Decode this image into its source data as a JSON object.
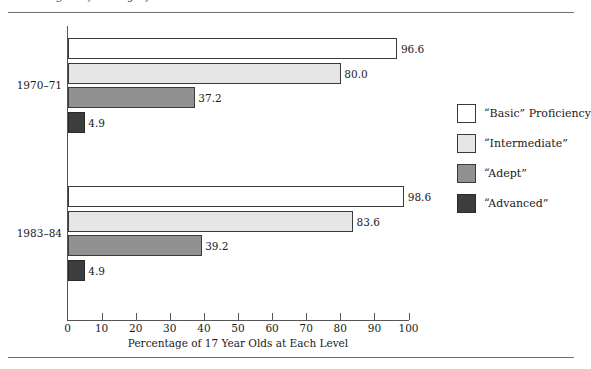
{
  "figure": {
    "clipped_caption": "Reading Proficiency of 17 Year Olds",
    "axis_title": "Percentage of 17 Year Olds at Each Level"
  },
  "legend": {
    "items": [
      {
        "label": "“Basic” Proficiency",
        "key": "basic",
        "color": "#ffffff"
      },
      {
        "label": "“Intermediate”",
        "key": "intermediate",
        "color": "#e6e6e6"
      },
      {
        "label": "“Adept”",
        "key": "adept",
        "color": "#919191"
      },
      {
        "label": "“Advanced”",
        "key": "advanced",
        "color": "#3d3d3d"
      }
    ]
  },
  "ticks": {
    "labels": [
      "0",
      "10",
      "20",
      "30",
      "40",
      "50",
      "60",
      "70",
      "80",
      "90",
      "100"
    ]
  },
  "groups": [
    {
      "label": "1970–71",
      "values": [
        "96.6",
        "80.0",
        "37.2",
        "4.9"
      ]
    },
    {
      "label": "1983–84",
      "values": [
        "98.6",
        "83.6",
        "39.2",
        "4.9"
      ]
    }
  ],
  "chart_data": {
    "type": "bar",
    "orientation": "horizontal",
    "title": "",
    "xlabel": "Percentage of 17 Year Olds at Each Level",
    "ylabel": "",
    "categories": [
      "1970–71",
      "1983–84"
    ],
    "xlim": [
      0,
      100
    ],
    "xticks": [
      0,
      10,
      20,
      30,
      40,
      50,
      60,
      70,
      80,
      90,
      100
    ],
    "grid": false,
    "legend_position": "right",
    "series": [
      {
        "name": "“Basic” Proficiency",
        "color": "#ffffff",
        "values": [
          96.6,
          98.6
        ]
      },
      {
        "name": "“Intermediate”",
        "color": "#e6e6e6",
        "values": [
          80.0,
          83.6
        ]
      },
      {
        "name": "“Adept”",
        "color": "#919191",
        "values": [
          37.2,
          39.2
        ]
      },
      {
        "name": "“Advanced”",
        "color": "#3d3d3d",
        "values": [
          4.9,
          4.9
        ]
      }
    ],
    "data_labels": [
      [
        "96.6",
        "80.0",
        "37.2",
        "4.9"
      ],
      [
        "98.6",
        "83.6",
        "39.2",
        "4.9"
      ]
    ]
  }
}
